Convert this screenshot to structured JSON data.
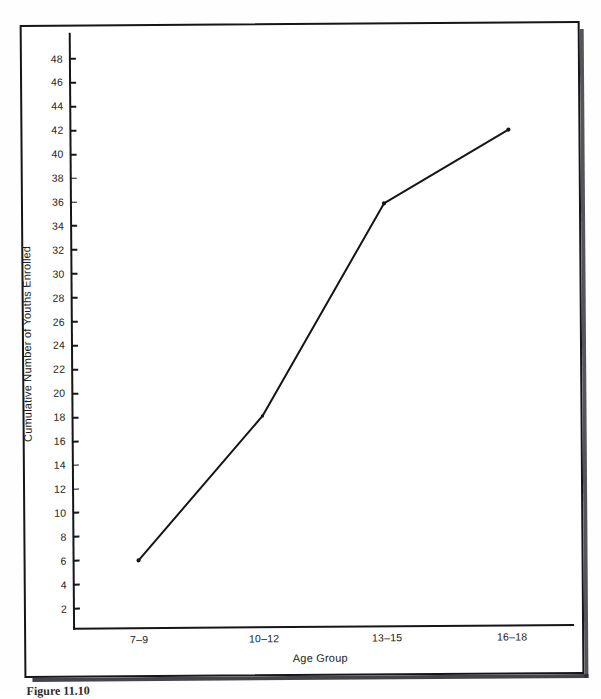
{
  "figure": {
    "caption": "Figure 11.10",
    "frame_color": "#15161a",
    "background_color": "#ffffff"
  },
  "chart_data": {
    "type": "line",
    "title": "",
    "subtitle": "",
    "xlabel": "Age Group",
    "ylabel": "Cumulative Number of Youths Enrolled",
    "categories": [
      "7–9",
      "10–12",
      "13–15",
      "16–18"
    ],
    "values": [
      6,
      18,
      35.7,
      41.8
    ],
    "series": [
      {
        "name": "Cumulative enrollment",
        "values": [
          6,
          18,
          35.7,
          41.8
        ],
        "color": "#15161a",
        "marker": "dot",
        "line_width": 2.0
      }
    ],
    "ylim": [
      0,
      49
    ],
    "yticks": [
      2,
      4,
      6,
      8,
      10,
      12,
      14,
      16,
      18,
      20,
      22,
      24,
      26,
      28,
      30,
      32,
      34,
      36,
      38,
      40,
      42,
      44,
      46,
      48
    ],
    "ytick_labels": [
      "2",
      "4",
      "6",
      "8",
      "10",
      "12",
      "14",
      "16",
      "18",
      "20",
      "22",
      "24",
      "26",
      "28",
      "30",
      "32",
      "34",
      "36",
      "38",
      "40",
      "42",
      "44",
      "46",
      "48"
    ],
    "xtick_labels": [
      "7–9",
      "10–12",
      "13–15",
      "16–18"
    ],
    "grid": false,
    "legend": false,
    "legend_position": "none",
    "annotations": []
  }
}
